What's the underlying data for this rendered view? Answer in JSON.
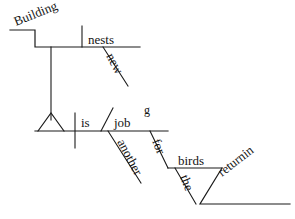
{
  "document": {
    "type": "reed-kellogg-sentence-diagram",
    "sentence": "Building new nests is another job for the returning birds.",
    "background_color": "#ffffff",
    "ink_color": "#1a1a1a",
    "width": 295,
    "height": 219
  },
  "words": {
    "gerund_subject": "Building",
    "gerund_object": "nests",
    "gerund_object_modifier": "new",
    "verb": "is",
    "predicate_nominative": "job",
    "predicate_modifier": "another",
    "preposition": "for",
    "prep_object": "birds",
    "prep_object_article": "the",
    "participle_main": "returnin",
    "participle_overflow": "g"
  },
  "labels": {
    "gerund_subject": {
      "x": 16,
      "y": 26,
      "rotate": -22
    },
    "gerund_object": {
      "x": 88,
      "y": 44,
      "rotate": 0
    },
    "gerund_object_modifier": {
      "x": 106,
      "y": 56,
      "rotate": 62
    },
    "verb": {
      "x": 81,
      "y": 127,
      "rotate": 0
    },
    "predicate_nominative": {
      "x": 114,
      "y": 127,
      "rotate": 0
    },
    "participle_overflow": {
      "x": 144,
      "y": 114,
      "rotate": 0
    },
    "predicate_modifier": {
      "x": 117,
      "y": 142,
      "rotate": 62
    },
    "preposition": {
      "x": 152,
      "y": 141,
      "rotate": 68
    },
    "prep_object": {
      "x": 178,
      "y": 165,
      "rotate": 0
    },
    "prep_object_article": {
      "x": 180,
      "y": 177,
      "rotate": 68
    },
    "participle_main": {
      "x": 222,
      "y": 177,
      "rotate": -38
    }
  },
  "strokes": {
    "gerund_step": "M 10,30 L 35,30 L 35,47 L 140,47",
    "gerund_object_divider": "M 82,26 L 82,47",
    "gerund_object_modifier_slant": "M 103,47 L 128,86",
    "gerund_stem": "M 51,47 L 51,120",
    "pedestal_triangle": "M 38,131 L 51,113 L 64,131",
    "main_baseline": "M 35,131 L 168,131",
    "subject_verb_divider": "M 75,113 L 75,148",
    "predicate_slant_divider": "M 113,108 L 101,131",
    "predicate_modifier_slant": "M 108,131 L 141,183",
    "preposition_slant": "M 150,131 L 168,168",
    "prep_object_baseline": "M 168,168 L 222,168",
    "prep_article_slant": "M 175,168 L 196,204",
    "participle_step": "M 222,168 L 200,204 L 290,204"
  }
}
